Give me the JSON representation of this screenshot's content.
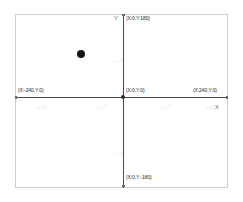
{
  "chart_data": {
    "type": "scatter",
    "title": "",
    "xlabel": "X",
    "ylabel": "Y",
    "xlim": [
      -240,
      240
    ],
    "ylim": [
      -180,
      180
    ],
    "grid": false,
    "legend": null,
    "points": [
      {
        "x": -98,
        "y": 93
      }
    ],
    "annotations": [
      {
        "id": "top",
        "text": "(X:0,Y:180)",
        "x": 0,
        "y": 180
      },
      {
        "id": "left",
        "text": "(X:-240,Y:0)",
        "x": -240,
        "y": 0
      },
      {
        "id": "origin",
        "text": "(X:0,Y:0)",
        "x": 0,
        "y": 0
      },
      {
        "id": "right",
        "text": "(X:240,Y:0)",
        "x": 240,
        "y": 0
      },
      {
        "id": "bottom",
        "text": "(X:0,Y:-180)",
        "x": 0,
        "y": -180
      }
    ]
  },
  "axes": {
    "y_letter": "Y",
    "x_letter": "X"
  },
  "labels": {
    "top": "(X:0,Y:180)",
    "left": "(X:-240,Y:0)",
    "origin": "(X:0,Y:0)",
    "right": "(X:240,Y:0)",
    "bottom": "(X:0,Y:-180)"
  },
  "colors": {
    "frame": "#cfcfcf",
    "axis": "#4a4a4a",
    "point": "#151515",
    "label_text": "#1d1d1d",
    "axis_letter": "#6e6e6e",
    "watermark": "#efefef",
    "background": "#ffffff"
  },
  "watermarks": [
    {
      "text": "map",
      "left": 36,
      "top": 104
    },
    {
      "text": "map",
      "left": 96,
      "top": 104
    },
    {
      "text": "map",
      "left": 160,
      "top": 104
    },
    {
      "text": "map",
      "left": 205,
      "top": 104
    },
    {
      "text": "map",
      "left": 113,
      "top": 58
    },
    {
      "text": "map",
      "left": 113,
      "top": 150
    }
  ]
}
